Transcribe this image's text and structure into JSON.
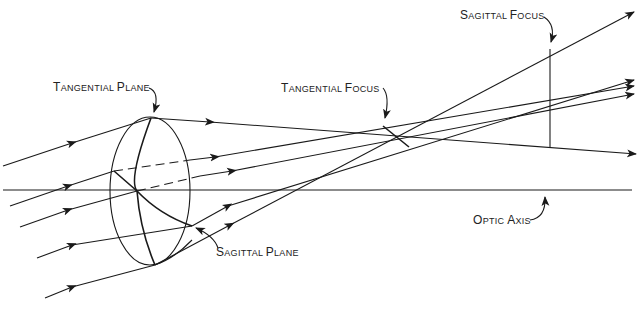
{
  "diagram": {
    "type": "optics-astigmatism",
    "labels": {
      "tangential_plane": {
        "first": "T",
        "rest": "ANGENTIAL ",
        "first2": "P",
        "rest2": "LANE"
      },
      "tangential_focus": {
        "first": "T",
        "rest": "ANGENTIAL ",
        "first2": "F",
        "rest2": "OCUS"
      },
      "sagittal_focus": {
        "first": "S",
        "rest": "AGITTAL ",
        "first2": "F",
        "rest2": "OCUS"
      },
      "sagittal_plane": {
        "first": "S",
        "rest": "AGITTAL ",
        "first2": "P",
        "rest2": "LANE"
      },
      "optic_axis": {
        "first": "O",
        "rest": "PTIC ",
        "first2": "A",
        "rest2": "XIS"
      }
    },
    "colors": {
      "ink": "#1a1a1a",
      "background": "#ffffff"
    }
  }
}
